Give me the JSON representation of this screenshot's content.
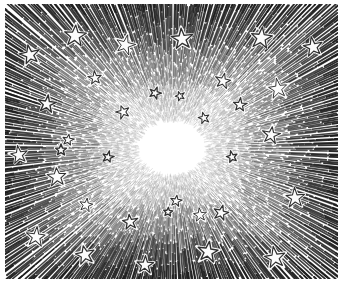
{
  "artwork": {
    "title": "Starburst",
    "medium": "wood engraving / pen hatching",
    "style": "vintage line-art burst",
    "canvas": {
      "width": 343,
      "height": 291
    },
    "colors": {
      "paper": "#ffffff",
      "ink": "#1a1a1a",
      "ink_mid": "#3d3d3d",
      "ink_light": "#6e6e6e",
      "center_void": "#fbfbfb"
    },
    "plate": {
      "left": 5,
      "top": 4,
      "right": 338,
      "bottom": 279,
      "note": "hatched rectangular plate area inset from image edge"
    },
    "burst": {
      "center_x": 172,
      "center_y": 148,
      "void_radius_x": 37,
      "void_radius_y": 29,
      "ray_count": 520,
      "ray_style": "dashed radial strokes, denser and darker toward plate edges"
    },
    "stars": [
      {
        "x": 75,
        "y": 36,
        "r": 11,
        "rot": 4
      },
      {
        "x": 30,
        "y": 55,
        "r": 10,
        "rot": -12
      },
      {
        "x": 125,
        "y": 45,
        "r": 10,
        "rot": 15
      },
      {
        "x": 95,
        "y": 78,
        "r": 7,
        "rot": -6
      },
      {
        "x": 47,
        "y": 104,
        "r": 9,
        "rot": 8
      },
      {
        "x": 123,
        "y": 112,
        "r": 7,
        "rot": -18
      },
      {
        "x": 68,
        "y": 140,
        "r": 6,
        "rot": 10
      },
      {
        "x": 182,
        "y": 39,
        "r": 11,
        "rot": -5
      },
      {
        "x": 261,
        "y": 38,
        "r": 11,
        "rot": 7
      },
      {
        "x": 313,
        "y": 47,
        "r": 10,
        "rot": -10
      },
      {
        "x": 223,
        "y": 81,
        "r": 8,
        "rot": 12
      },
      {
        "x": 278,
        "y": 89,
        "r": 10,
        "rot": -8
      },
      {
        "x": 240,
        "y": 105,
        "r": 7,
        "rot": 5
      },
      {
        "x": 204,
        "y": 118,
        "r": 6,
        "rot": -14
      },
      {
        "x": 271,
        "y": 135,
        "r": 9,
        "rot": 9
      },
      {
        "x": 19,
        "y": 155,
        "r": 9,
        "rot": -9
      },
      {
        "x": 108,
        "y": 157,
        "r": 6,
        "rot": 13
      },
      {
        "x": 57,
        "y": 177,
        "r": 10,
        "rot": -4
      },
      {
        "x": 86,
        "y": 205,
        "r": 7,
        "rot": 11
      },
      {
        "x": 130,
        "y": 222,
        "r": 8,
        "rot": -7
      },
      {
        "x": 36,
        "y": 237,
        "r": 10,
        "rot": 6
      },
      {
        "x": 85,
        "y": 255,
        "r": 10,
        "rot": -11
      },
      {
        "x": 145,
        "y": 265,
        "r": 9,
        "rot": 3
      },
      {
        "x": 232,
        "y": 157,
        "r": 6,
        "rot": -13
      },
      {
        "x": 176,
        "y": 201,
        "r": 6,
        "rot": 9
      },
      {
        "x": 200,
        "y": 215,
        "r": 7,
        "rot": -6
      },
      {
        "x": 221,
        "y": 213,
        "r": 8,
        "rot": 14
      },
      {
        "x": 295,
        "y": 198,
        "r": 10,
        "rot": -3
      },
      {
        "x": 208,
        "y": 252,
        "r": 11,
        "rot": 8
      },
      {
        "x": 275,
        "y": 258,
        "r": 11,
        "rot": -9
      },
      {
        "x": 61,
        "y": 150,
        "r": 6,
        "rot": 0
      },
      {
        "x": 155,
        "y": 93,
        "r": 6,
        "rot": 20
      },
      {
        "x": 180,
        "y": 96,
        "r": 5,
        "rot": -20
      },
      {
        "x": 168,
        "y": 212,
        "r": 5,
        "rot": 5
      }
    ]
  }
}
